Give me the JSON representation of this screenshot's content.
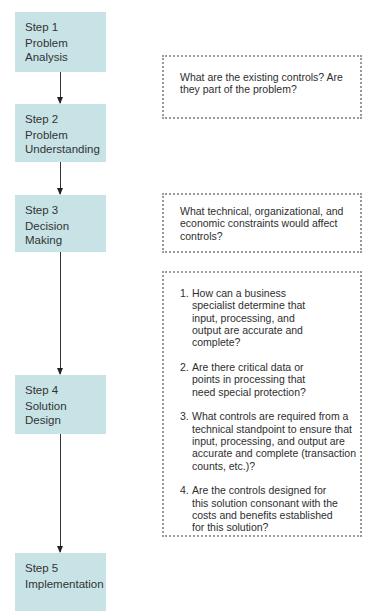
{
  "steps": [
    {
      "num": "Step 1",
      "name": "Problem Analysis"
    },
    {
      "num": "Step 2",
      "name": "Problem Understanding"
    },
    {
      "num": "Step 3",
      "name": "Decision Making"
    },
    {
      "num": "Step 4",
      "name": "Solution Design"
    },
    {
      "num": "Step 5",
      "name": "Implementation"
    }
  ],
  "notes": {
    "step1": "What are the existing controls? Are they part of the problem?",
    "step3": "What technical, organizational, and economic constraints would affect controls?",
    "step4": [
      {
        "n": "1.",
        "text": "How can a business specialist determine that input, processing, and output are accurate and complete?"
      },
      {
        "n": "2.",
        "text": "Are there critical data or points in processing that need special protection?"
      },
      {
        "n": "3.",
        "text": "What controls are required from a technical standpoint to ensure that input, processing, and output are accurate and complete (transaction counts, etc.)?"
      },
      {
        "n": "4.",
        "text": "Are the controls designed for this solution consonant with the costs and benefits established for this solution?"
      }
    ]
  },
  "colors": {
    "step_fill": "#c7e3e6",
    "arrow": "#333333",
    "note_border": "#9a9a9a"
  }
}
